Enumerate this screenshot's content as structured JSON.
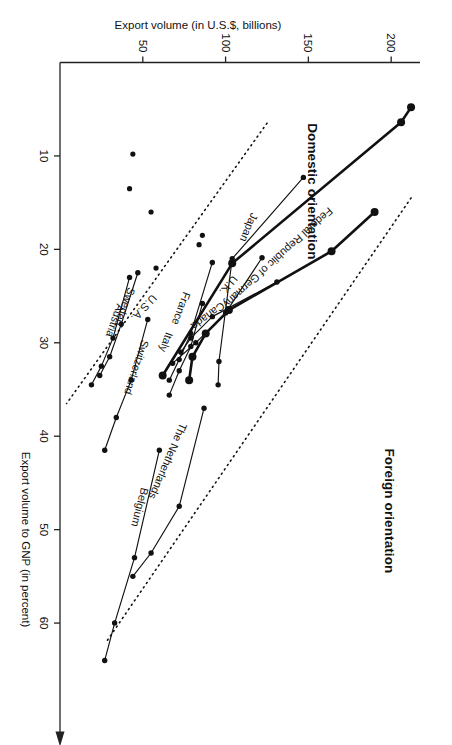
{
  "figure": {
    "orientation_note": "page rotated 90 degrees",
    "region_titles": {
      "foreign": "Foreign orientation",
      "domestic": "Domestic orientation"
    }
  },
  "chart_data": {
    "type": "scatter",
    "title": "",
    "subtitle": "",
    "xlabel": "Export volume to GNP (in percent)",
    "ylabel": "Export volume (in U.S.$, billions)",
    "xlim": [
      0,
      70
    ],
    "ylim": [
      0,
      215
    ],
    "xticks": [
      10,
      20,
      30,
      40,
      50,
      60
    ],
    "yticks": [
      50,
      100,
      150,
      200
    ],
    "grid": false,
    "legend": false,
    "annotations": [
      "Foreign orientation",
      "Domestic orientation"
    ],
    "reference_lines": [
      {
        "name": "upper-divider",
        "style": "dotted",
        "x": [
          14.5,
          62.0
        ],
        "y": [
          212.0,
          28.0
        ]
      },
      {
        "name": "lower-divider",
        "style": "dotted",
        "x": [
          6.5,
          36.5
        ],
        "y": [
          125.0,
          4.0
        ]
      }
    ],
    "series": [
      {
        "name": "U.S.A.",
        "emphasis": "bold",
        "label_anchor": {
          "x": 26.0,
          "y": 49.0
        },
        "points": [
          {
            "x": 4.8,
            "y": 212.0
          },
          {
            "x": 6.4,
            "y": 206.0
          },
          {
            "x": 21.5,
            "y": 104.0
          },
          {
            "x": 33.5,
            "y": 62.0
          }
        ]
      },
      {
        "name": "Japan",
        "emphasis": "normal",
        "label_anchor": {
          "x": 17.5,
          "y": 112.0
        },
        "points": [
          {
            "x": 12.3,
            "y": 147.0
          },
          {
            "x": 21.0,
            "y": 104.0
          },
          {
            "x": 32.0,
            "y": 96.0
          },
          {
            "x": 34.5,
            "y": 95.5
          }
        ]
      },
      {
        "name": "Federal Republic of Germany",
        "emphasis": "bold",
        "label_anchor": {
          "x": 20.6,
          "y": 130.0
        },
        "points": [
          {
            "x": 16.0,
            "y": 190.0
          },
          {
            "x": 20.2,
            "y": 164.0
          },
          {
            "x": 26.5,
            "y": 102.0
          },
          {
            "x": 29.0,
            "y": 88.0
          },
          {
            "x": 31.5,
            "y": 80.0
          },
          {
            "x": 34.0,
            "y": 78.0
          }
        ]
      },
      {
        "name": "U.K.",
        "emphasis": "normal",
        "label_anchor": {
          "x": 23.6,
          "y": 100.0
        },
        "points": [
          {
            "x": 20.9,
            "y": 122.0
          },
          {
            "x": 26.8,
            "y": 100.0
          },
          {
            "x": 30.0,
            "y": 82.0
          },
          {
            "x": 32.2,
            "y": 68.0
          }
        ]
      },
      {
        "name": "Canada",
        "emphasis": "normal",
        "label_anchor": {
          "x": 26.8,
          "y": 88.0
        },
        "points": [
          {
            "x": 23.5,
            "y": 131.0
          },
          {
            "x": 27.2,
            "y": 92.0
          },
          {
            "x": 29.5,
            "y": 79.0
          },
          {
            "x": 31.0,
            "y": 73.0
          }
        ]
      },
      {
        "name": "France",
        "emphasis": "normal",
        "label_anchor": {
          "x": 26.2,
          "y": 71.0
        },
        "points": [
          {
            "x": 21.4,
            "y": 92.0
          },
          {
            "x": 29.0,
            "y": 79.0
          },
          {
            "x": 31.8,
            "y": 72.0
          },
          {
            "x": 34.0,
            "y": 66.0
          }
        ]
      },
      {
        "name": "Italy",
        "emphasis": "normal",
        "label_anchor": {
          "x": 29.8,
          "y": 62.0
        },
        "points": [
          {
            "x": 25.8,
            "y": 86.0
          },
          {
            "x": 30.4,
            "y": 79.0
          },
          {
            "x": 33.0,
            "y": 72.0
          },
          {
            "x": 35.6,
            "y": 66.0
          }
        ]
      },
      {
        "name": "The Netherlands",
        "emphasis": "normal",
        "label_anchor": {
          "x": 42.5,
          "y": 63.0
        },
        "points": [
          {
            "x": 37.0,
            "y": 87.0
          },
          {
            "x": 47.5,
            "y": 72.0
          },
          {
            "x": 52.5,
            "y": 55.0
          },
          {
            "x": 55.0,
            "y": 44.0
          }
        ]
      },
      {
        "name": "Belgium",
        "emphasis": "normal",
        "label_anchor": {
          "x": 47.5,
          "y": 46.0
        },
        "points": [
          {
            "x": 41.5,
            "y": 60.0
          },
          {
            "x": 53.0,
            "y": 45.0
          },
          {
            "x": 60.0,
            "y": 33.0
          },
          {
            "x": 64.0,
            "y": 27.0
          }
        ]
      },
      {
        "name": "Switzerland",
        "emphasis": "normal",
        "label_anchor": {
          "x": 32.5,
          "y": 44.0
        },
        "points": [
          {
            "x": 27.5,
            "y": 53.0
          },
          {
            "x": 34.0,
            "y": 43.0
          },
          {
            "x": 38.0,
            "y": 34.0
          },
          {
            "x": 41.5,
            "y": 27.0
          }
        ]
      },
      {
        "name": "Sweden",
        "emphasis": "normal",
        "label_anchor": {
          "x": 26.0,
          "y": 37.0
        },
        "points": [
          {
            "x": 22.5,
            "y": 47.0
          },
          {
            "x": 28.0,
            "y": 37.0
          },
          {
            "x": 31.5,
            "y": 30.0
          },
          {
            "x": 33.5,
            "y": 24.0
          }
        ]
      },
      {
        "name": "Austria",
        "emphasis": "normal",
        "label_anchor": {
          "x": 27.5,
          "y": 31.0
        },
        "points": [
          {
            "x": 23.0,
            "y": 42.0
          },
          {
            "x": 29.5,
            "y": 32.0
          },
          {
            "x": 32.5,
            "y": 25.0
          },
          {
            "x": 34.5,
            "y": 19.0
          }
        ]
      }
    ],
    "extra_points": [
      {
        "x": 18.5,
        "y": 86.0
      },
      {
        "x": 19.5,
        "y": 84.0
      },
      {
        "x": 22.0,
        "y": 58.0
      },
      {
        "x": 9.8,
        "y": 44.0
      },
      {
        "x": 13.5,
        "y": 42.0
      },
      {
        "x": 16.0,
        "y": 55.0
      }
    ]
  }
}
